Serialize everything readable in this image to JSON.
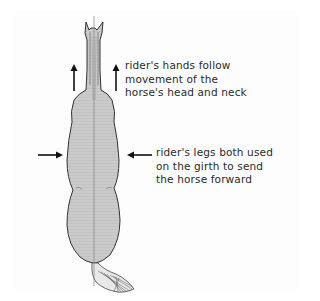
{
  "diagram": {
    "colors": {
      "background": "#ffffff",
      "panel": "#fdfdfd",
      "horse_fill": "#c9c9c9",
      "horse_outline": "#333333",
      "center_line": "#8a8a8a",
      "arrow": "#111111",
      "text": "#2a2a2a"
    },
    "annotations": [
      {
        "id": "hands",
        "arrow_direction": "up",
        "arrow_count": 2,
        "lines": [
          "rider's hands follow",
          "movement of the",
          "horse's head and neck"
        ]
      },
      {
        "id": "legs",
        "arrow_direction": "inward",
        "arrow_count": 2,
        "lines": [
          "rider's legs both used",
          "on the girth to send",
          "the horse forward"
        ]
      }
    ]
  }
}
